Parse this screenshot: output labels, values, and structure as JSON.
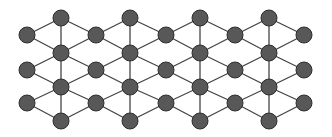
{
  "diagram": {
    "type": "lattice-graph",
    "colors": {
      "background": "#ffffff",
      "node_fill": "#585858",
      "node_stroke": "#2e2e2e",
      "edge": "#444444"
    },
    "node_radius": 8,
    "nodes": [
      {
        "id": "a1",
        "x": 27,
        "y": 35
      },
      {
        "id": "a2",
        "x": 27,
        "y": 70
      },
      {
        "id": "a3",
        "x": 27,
        "y": 103
      },
      {
        "id": "b1",
        "x": 61,
        "y": 18
      },
      {
        "id": "b2",
        "x": 61,
        "y": 53
      },
      {
        "id": "b3",
        "x": 61,
        "y": 87
      },
      {
        "id": "b4",
        "x": 61,
        "y": 121
      },
      {
        "id": "c1",
        "x": 96,
        "y": 35
      },
      {
        "id": "c2",
        "x": 96,
        "y": 70
      },
      {
        "id": "c3",
        "x": 96,
        "y": 103
      },
      {
        "id": "d1",
        "x": 130,
        "y": 18
      },
      {
        "id": "d2",
        "x": 130,
        "y": 53
      },
      {
        "id": "d3",
        "x": 130,
        "y": 87
      },
      {
        "id": "d4",
        "x": 130,
        "y": 121
      },
      {
        "id": "e1",
        "x": 166,
        "y": 35
      },
      {
        "id": "e2",
        "x": 166,
        "y": 70
      },
      {
        "id": "e3",
        "x": 166,
        "y": 103
      },
      {
        "id": "f1",
        "x": 200,
        "y": 18
      },
      {
        "id": "f2",
        "x": 200,
        "y": 53
      },
      {
        "id": "f3",
        "x": 200,
        "y": 87
      },
      {
        "id": "f4",
        "x": 200,
        "y": 121
      },
      {
        "id": "g1",
        "x": 235,
        "y": 35
      },
      {
        "id": "g2",
        "x": 235,
        "y": 70
      },
      {
        "id": "g3",
        "x": 235,
        "y": 103
      },
      {
        "id": "h1",
        "x": 269,
        "y": 18
      },
      {
        "id": "h2",
        "x": 269,
        "y": 53
      },
      {
        "id": "h3",
        "x": 269,
        "y": 87
      },
      {
        "id": "h4",
        "x": 269,
        "y": 121
      },
      {
        "id": "i1",
        "x": 304,
        "y": 35
      },
      {
        "id": "i2",
        "x": 304,
        "y": 70
      },
      {
        "id": "i3",
        "x": 304,
        "y": 103
      }
    ],
    "edges": [
      [
        "b1",
        "b2"
      ],
      [
        "b2",
        "b3"
      ],
      [
        "b3",
        "b4"
      ],
      [
        "d1",
        "d2"
      ],
      [
        "d2",
        "d3"
      ],
      [
        "d3",
        "d4"
      ],
      [
        "f1",
        "f2"
      ],
      [
        "f2",
        "f3"
      ],
      [
        "f3",
        "f4"
      ],
      [
        "h1",
        "h2"
      ],
      [
        "h2",
        "h3"
      ],
      [
        "h3",
        "h4"
      ],
      [
        "a1",
        "b1"
      ],
      [
        "a1",
        "b2"
      ],
      [
        "a2",
        "b2"
      ],
      [
        "a2",
        "b3"
      ],
      [
        "a3",
        "b3"
      ],
      [
        "a3",
        "b4"
      ],
      [
        "b1",
        "c1"
      ],
      [
        "b2",
        "c1"
      ],
      [
        "b2",
        "c2"
      ],
      [
        "b3",
        "c2"
      ],
      [
        "b3",
        "c3"
      ],
      [
        "b4",
        "c3"
      ],
      [
        "c1",
        "d1"
      ],
      [
        "c1",
        "d2"
      ],
      [
        "c2",
        "d2"
      ],
      [
        "c2",
        "d3"
      ],
      [
        "c3",
        "d3"
      ],
      [
        "c3",
        "d4"
      ],
      [
        "d1",
        "e1"
      ],
      [
        "d2",
        "e1"
      ],
      [
        "d2",
        "e2"
      ],
      [
        "d3",
        "e2"
      ],
      [
        "d3",
        "e3"
      ],
      [
        "d4",
        "e3"
      ],
      [
        "e1",
        "f1"
      ],
      [
        "e1",
        "f2"
      ],
      [
        "e2",
        "f2"
      ],
      [
        "e2",
        "f3"
      ],
      [
        "e3",
        "f3"
      ],
      [
        "e3",
        "f4"
      ],
      [
        "f1",
        "g1"
      ],
      [
        "f2",
        "g1"
      ],
      [
        "f2",
        "g2"
      ],
      [
        "f3",
        "g2"
      ],
      [
        "f3",
        "g3"
      ],
      [
        "f4",
        "g3"
      ],
      [
        "g1",
        "h1"
      ],
      [
        "g1",
        "h2"
      ],
      [
        "g2",
        "h2"
      ],
      [
        "g2",
        "h3"
      ],
      [
        "g3",
        "h3"
      ],
      [
        "g3",
        "h4"
      ],
      [
        "h1",
        "i1"
      ],
      [
        "h2",
        "i1"
      ],
      [
        "h2",
        "i2"
      ],
      [
        "h3",
        "i2"
      ],
      [
        "h3",
        "i3"
      ],
      [
        "h4",
        "i3"
      ]
    ]
  }
}
